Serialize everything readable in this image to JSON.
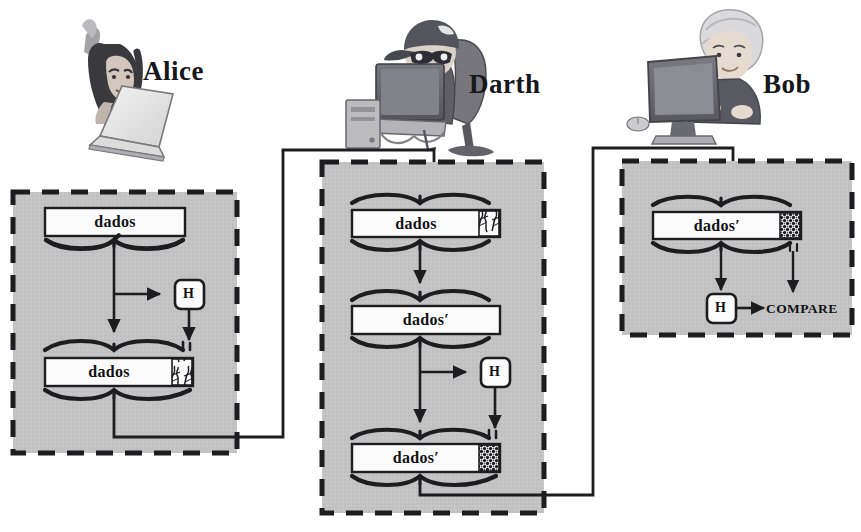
{
  "diagram": {
    "colors": {
      "panel_fill": "#c3c3c3",
      "panel_border": "#1d1d20",
      "bar_fill": "#fbfbfb",
      "stroke": "#1d1d20",
      "text": "#121214"
    },
    "actors": [
      {
        "id": "alice",
        "name": "Alice",
        "figure_icon": "woman-at-laptop-icon"
      },
      {
        "id": "darth",
        "name": "Darth",
        "figure_icon": "attacker-at-computer-icon"
      },
      {
        "id": "bob",
        "name": "Bob",
        "figure_icon": "boy-at-computer-icon"
      }
    ],
    "panels": [
      {
        "id": "alice-panel",
        "owner": "Alice",
        "blocks": [
          {
            "id": "alice-data-1",
            "label": "dados",
            "appendix": "none"
          },
          {
            "id": "alice-data-2",
            "label": "dados",
            "appendix": "scribble"
          }
        ],
        "hash_label": "H"
      },
      {
        "id": "darth-panel",
        "owner": "Darth",
        "blocks": [
          {
            "id": "darth-data-1",
            "label": "dados",
            "appendix": "scribble"
          },
          {
            "id": "darth-data-2",
            "label": "dados′",
            "appendix": "none"
          },
          {
            "id": "darth-data-3",
            "label": "dados′",
            "appendix": "checker"
          }
        ],
        "hash_label": "H"
      },
      {
        "id": "bob-panel",
        "owner": "Bob",
        "blocks": [
          {
            "id": "bob-data-1",
            "label": "dados′",
            "appendix": "checker"
          }
        ],
        "hash_label": "H",
        "compare_label": "COMPARE"
      }
    ],
    "connectors": [
      {
        "id": "alice-to-darth",
        "from": "alice-panel",
        "to": "darth-panel"
      },
      {
        "id": "darth-to-bob",
        "from": "darth-panel",
        "to": "bob-panel"
      }
    ]
  }
}
